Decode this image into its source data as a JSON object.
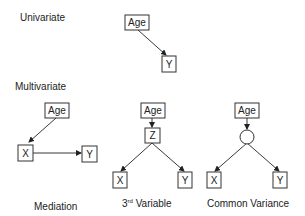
{
  "labels": {
    "univariate": "Univariate",
    "multivariate": "Multivariate",
    "mediation": "Mediation",
    "third_variable_base": "3",
    "third_variable_sup": "rd",
    "third_variable_rest": " Variable",
    "common_variance": "Common Variance"
  },
  "nodes": {
    "age": "Age",
    "x": "X",
    "y": "Y",
    "z": "Z"
  },
  "diagrams": [
    {
      "name": "Univariate",
      "edges": [
        [
          "Age",
          "Y"
        ]
      ]
    },
    {
      "name": "Mediation",
      "edges": [
        [
          "Age",
          "X"
        ],
        [
          "X",
          "Y"
        ]
      ]
    },
    {
      "name": "3rd Variable",
      "edges": [
        [
          "Age",
          "Z"
        ],
        [
          "Z",
          "X"
        ],
        [
          "Z",
          "Y"
        ]
      ]
    },
    {
      "name": "Common Variance",
      "edges": [
        [
          "Age",
          "latent"
        ],
        [
          "latent",
          "X"
        ],
        [
          "latent",
          "Y"
        ]
      ]
    }
  ]
}
